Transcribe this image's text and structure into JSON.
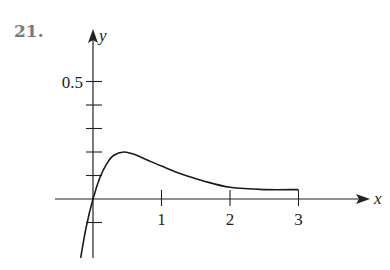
{
  "problem": {
    "number": "21."
  },
  "chart_data": {
    "type": "line",
    "title": "",
    "xlabel": "x",
    "ylabel": "y",
    "x_ticks": [
      1,
      2,
      3
    ],
    "x_tick_labels": [
      "1",
      "2",
      "3"
    ],
    "y_ticks": [
      -0.1,
      0.1,
      0.2,
      0.3,
      0.4,
      0.5
    ],
    "y_tick_labels": [
      "0.5"
    ],
    "xlim": [
      -0.3,
      4.0
    ],
    "ylim": [
      -0.25,
      0.72
    ],
    "grid": false,
    "legend": null,
    "series": [
      {
        "name": "curve",
        "x": [
          -0.18,
          -0.1,
          0.0,
          0.1,
          0.2,
          0.3,
          0.45,
          0.6,
          0.8,
          1.0,
          1.3,
          1.6,
          2.0,
          2.5,
          3.0
        ],
        "y": [
          -0.25,
          -0.12,
          0.0,
          0.09,
          0.15,
          0.185,
          0.2,
          0.19,
          0.165,
          0.14,
          0.105,
          0.078,
          0.05,
          0.04,
          0.04
        ]
      }
    ]
  }
}
